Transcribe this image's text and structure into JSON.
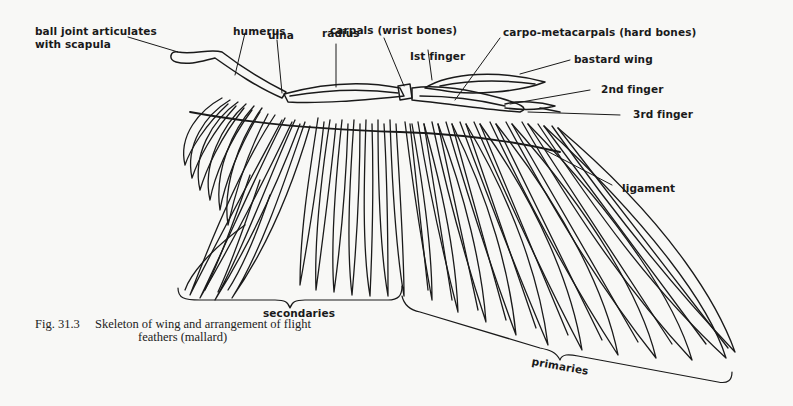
{
  "figure": {
    "number": "Fig. 31.3",
    "caption_line1": "Skeleton of wing and arrangement of flight",
    "caption_line2": "feathers (mallard)"
  },
  "labels": {
    "ball_joint": "ball joint articulates\nwith scapula",
    "humerus": "humerus",
    "ulna": "ulna",
    "radius": "radius",
    "carpals": "carpals (wrist bones)",
    "first_finger": "Ist finger",
    "carpo_metacarpals": "carpo-metacarpals (hard bones)",
    "bastard_wing": "bastard wing",
    "second_finger": "2nd finger",
    "third_finger": "3rd finger",
    "ligament": "ligament",
    "secondaries": "secondaries",
    "primaries": "primaries"
  },
  "colors": {
    "background": "#f8f8f6",
    "ink": "#1a1a1a"
  }
}
